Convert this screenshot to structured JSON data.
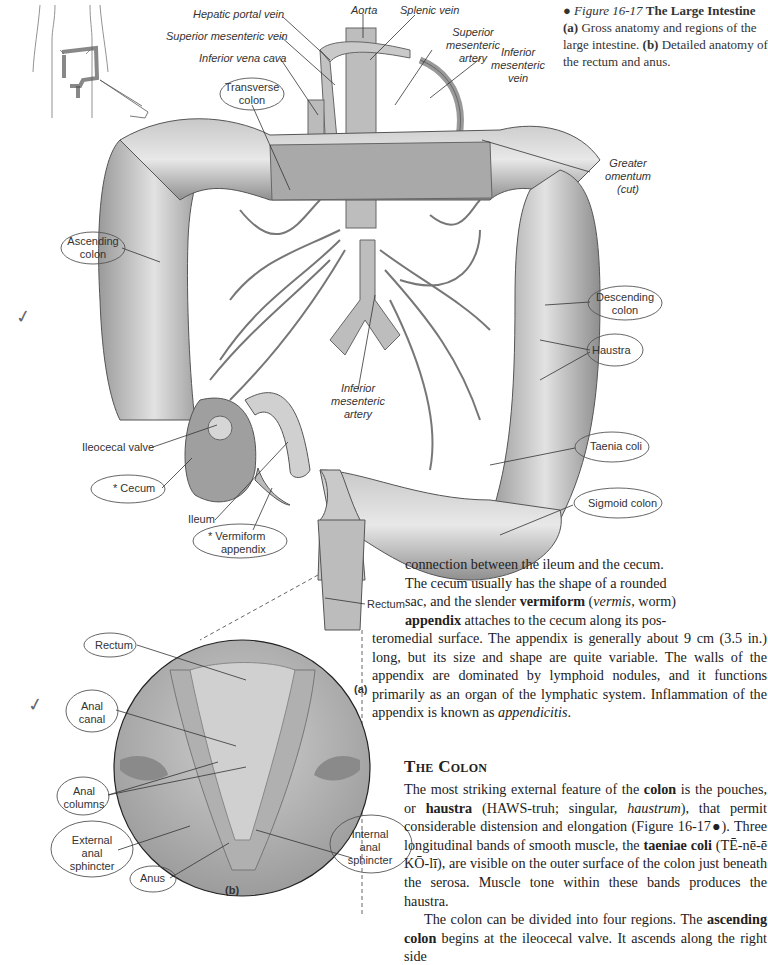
{
  "figure": {
    "bullet": "●",
    "number": "Figure 16-17",
    "title": "The Large Intestine",
    "caption_a_marker": "(a)",
    "caption_a": "Gross anatomy and regions of the large intestine.",
    "caption_b_marker": "(b)",
    "caption_b": "Detailed anatomy of the rectum and anus.",
    "panel_a_label": "(a)",
    "panel_b_label": "(b)"
  },
  "labels_a": {
    "hepatic_portal_vein": "Hepatic portal vein",
    "superior_mesenteric_vein": "Superior mesenteric vein",
    "inferior_vena_cava": "Inferior vena cava",
    "aorta": "Aorta",
    "splenic_vein": "Splenic vein",
    "superior_mesenteric_artery_1": "Superior",
    "superior_mesenteric_artery_2": "mesenteric",
    "superior_mesenteric_artery_3": "artery",
    "inferior_mesenteric_vein_1": "Inferior",
    "inferior_mesenteric_vein_2": "mesenteric",
    "inferior_mesenteric_vein_3": "vein",
    "transverse_colon_1": "Transverse",
    "transverse_colon_2": "colon",
    "greater_omentum_1": "Greater",
    "greater_omentum_2": "omentum",
    "greater_omentum_3": "(cut)",
    "ascending_colon_1": "Ascending",
    "ascending_colon_2": "colon",
    "descending_colon_1": "Descending",
    "descending_colon_2": "colon",
    "haustra": "Haustra",
    "inferior_mesenteric_artery_1": "Inferior",
    "inferior_mesenteric_artery_2": "mesenteric",
    "inferior_mesenteric_artery_3": "artery",
    "ileocecal_valve": "Ileocecal valve",
    "cecum": "Cecum",
    "cecum_mark": "*",
    "taenia_coli": "Taenia coli",
    "sigmoid_colon": "Sigmoid colon",
    "ileum": "Ileum",
    "vermiform_appendix_1": "Vermiform",
    "vermiform_appendix_2": "appendix",
    "appendix_mark": "*",
    "rectum": "Rectum"
  },
  "labels_b": {
    "rectum": "Rectum",
    "anal_canal_1": "Anal",
    "anal_canal_2": "canal",
    "anal_columns_1": "Anal",
    "anal_columns_2": "columns",
    "external_anal_sphincter_1": "External",
    "external_anal_sphincter_2": "anal",
    "external_anal_sphincter_3": "sphincter",
    "anus": "Anus",
    "internal_anal_sphincter_1": "Internal",
    "internal_anal_sphincter_2": "anal",
    "internal_anal_sphincter_3": "sphincter"
  },
  "annotations": {
    "checkmark_1": "✓",
    "checkmark_2": "✓"
  },
  "text": {
    "para1": [
      "connection between the ileum and the cecum.",
      "The cecum usually has the shape of a rounded",
      "sac, and the slender ",
      "vermiform",
      " (",
      "vermis",
      ", worm)",
      "appendix",
      " attaches to the cecum along its pos-",
      "teromedial surface. The appendix is generally about 9 cm (3.5 in.) long, but its size and shape are quite variable. The walls of the appendix are dominated by lymphoid nodules, and it functions primarily as an organ of the lymphatic system. Inflammation of the appendix is known as ",
      "appendicitis",
      "."
    ],
    "heading": "The Colon",
    "para2": [
      "The most striking external feature of the ",
      "colon",
      " is the pouches, or ",
      "haustra",
      " (HAWS-truh; singular, ",
      "haustrum",
      "), that permit considerable distension and elongation (Figure 16-17●). Three longitudinal bands of smooth muscle, the ",
      "taeniae coli",
      " (TĒ-nē-ē KŌ-lī), are visible on the outer surface of the colon just beneath the serosa. Muscle tone within these bands produces the haustra."
    ],
    "para3": [
      "The colon can be divided into four regions. The ",
      "ascending colon",
      " begins at the ileocecal valve. It ascends along the right side"
    ]
  }
}
